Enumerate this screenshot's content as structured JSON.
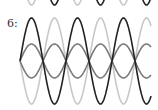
{
  "figure": {
    "label": "6:",
    "waves": [
      {
        "name": "dark",
        "color": "#222222",
        "amplitude": 43,
        "period": 46,
        "phase": 0
      },
      {
        "name": "light",
        "color": "#c8c8c8",
        "amplitude": 43,
        "period": 46,
        "phase": 3.14159
      },
      {
        "name": "medium",
        "color": "#7a7a7a",
        "amplitude": 17,
        "period": 46,
        "phase": 0
      },
      {
        "name": "medium-mirror",
        "color": "#7a7a7a",
        "amplitude": 17,
        "period": 46,
        "phase": 3.14159
      }
    ]
  }
}
